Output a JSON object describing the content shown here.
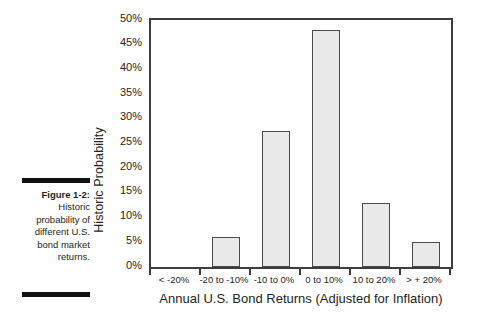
{
  "figure": {
    "label": "Figure 1-2:",
    "caption": "Historic probability of different U.S. bond market returns."
  },
  "chart_data": {
    "type": "bar",
    "title": "",
    "xlabel": "Annual U.S. Bond Returns (Adjusted for Inflation)",
    "ylabel": "Historic Probability",
    "categories": [
      "< -20%",
      "-20 to -10%",
      "-10 to 0%",
      "0 to 10%",
      "10 to 20%",
      "> + 20%"
    ],
    "values": [
      0,
      6,
      27.5,
      48,
      13,
      5
    ],
    "ylim": [
      0,
      50
    ],
    "ytick_labels": [
      "50%",
      "45%",
      "40%",
      "35%",
      "30%",
      "25%",
      "20%",
      "15%",
      "10%",
      "5%",
      "0%"
    ],
    "ytick_values": [
      50,
      45,
      40,
      35,
      30,
      25,
      20,
      15,
      10,
      5,
      0
    ],
    "grid": false,
    "legend": "none",
    "bar_fill": "#e9e9e9",
    "bar_border": "#4a4a4a",
    "axis_color": "#3d3d3d"
  }
}
